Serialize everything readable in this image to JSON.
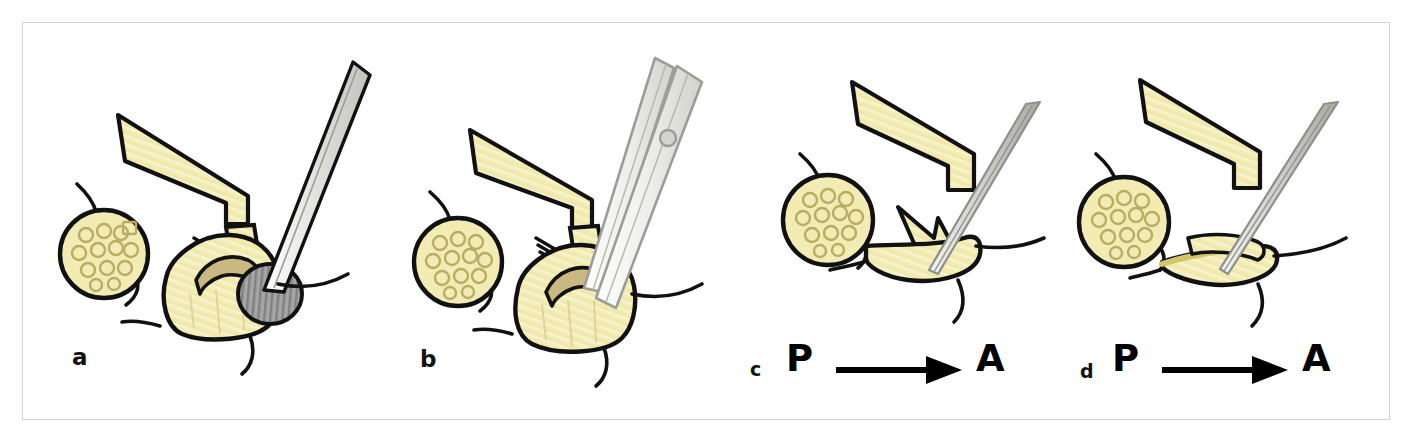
{
  "figure": {
    "kind": "surgical-illustration",
    "panel_count": 4,
    "background_color": "#ffffff",
    "frame_border_color": "#d3d3d3"
  },
  "colors": {
    "outline": "#111111",
    "tissue_yellow": "#f4eebb",
    "tissue_yellow_light": "#faf6d9",
    "tissue_yellow_deep": "#e8dd8f",
    "disc_gray": "#9a9a9a",
    "instrument_gray": "#c9c9c4",
    "instrument_gray_light": "#e4e4df",
    "nerve_circle_fill": "#f2ecb4",
    "arrow_black": "#000000"
  },
  "panels": [
    {
      "id": "a",
      "letter": "a",
      "direction_label": null,
      "elements": [
        "lamina-retractor",
        "nerve-root-cross-section",
        "nerve-rootlets",
        "disc-herniation-sphere",
        "probe-instrument",
        "vertebral-body"
      ]
    },
    {
      "id": "b",
      "letter": "b",
      "direction_label": null,
      "elements": [
        "lamina-retractor",
        "nerve-root-cross-section",
        "nerve-rootlets",
        "forceps-instrument",
        "forceps-rivet",
        "vertebral-body"
      ]
    },
    {
      "id": "c",
      "letter": "c",
      "direction_label": {
        "from": "P",
        "to": "A",
        "arrow": "right-arrow"
      },
      "elements": [
        "lamina-retractor",
        "nerve-root-cross-section",
        "annulus-flap",
        "needle-instrument",
        "vertebral-body"
      ]
    },
    {
      "id": "d",
      "letter": "d",
      "direction_label": {
        "from": "P",
        "to": "A",
        "arrow": "right-arrow"
      },
      "elements": [
        "lamina-retractor",
        "nerve-root-cross-section",
        "collapsed-disc-space",
        "needle-instrument",
        "vertebral-body"
      ]
    }
  ]
}
